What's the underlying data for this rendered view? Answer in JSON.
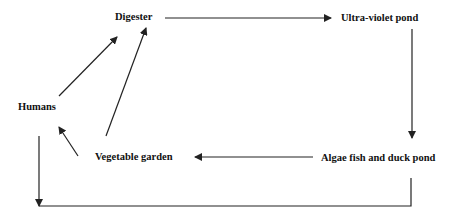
{
  "diagram": {
    "type": "flow-cycle",
    "nodes": {
      "digester": "Digester",
      "uv_pond": "Ultra-violet pond",
      "algae_pond": "Algae fish and duck pond",
      "vegetable_garden": "Vegetable garden",
      "humans": "Humans"
    },
    "edges": [
      {
        "from": "Digester",
        "to": "Ultra-violet pond"
      },
      {
        "from": "Ultra-violet pond",
        "to": "Algae fish and duck pond"
      },
      {
        "from": "Algae fish and duck pond",
        "to": "Vegetable garden"
      },
      {
        "from": "Vegetable garden",
        "to": "Humans"
      },
      {
        "from": "Vegetable garden",
        "to": "Digester"
      },
      {
        "from": "Humans",
        "to": "Digester"
      },
      {
        "from": "Algae fish and duck pond",
        "to": "Humans",
        "note": "bottom loop line; arrowhead on left end pointing down"
      }
    ],
    "colors": {
      "line": "#222222",
      "text": "#111111",
      "background": "#ffffff"
    }
  }
}
